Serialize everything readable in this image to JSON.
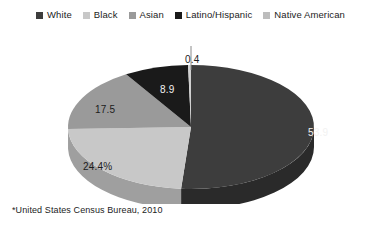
{
  "chart_data": {
    "type": "pie",
    "title": "",
    "subtitle": "",
    "xlabel": "",
    "ylabel": "",
    "legend_position": "top",
    "grid": false,
    "three_d": true,
    "units": "percent",
    "categories": [
      "White",
      "Black",
      "Asian",
      "Latino/Hispanic",
      "Native American"
    ],
    "values": [
      53.9,
      24.4,
      17.5,
      8.9,
      0.4
    ],
    "data_labels": [
      "53.9",
      "24.4%",
      "17.5",
      "8.9",
      "0.4"
    ],
    "colors": [
      "#3d3d3d",
      "#c8c8c8",
      "#9a9a9a",
      "#1a1a1a",
      "#d0d0d0"
    ],
    "side_colors": [
      "#2a2a2a",
      "#9f9f9f",
      "#757575",
      "#101010",
      "#a8a8a8"
    ],
    "label_text_colors": [
      "#f2f2f2",
      "#1c1c1c",
      "#1c1c1c",
      "#f2f2f2",
      "#1c1c1c"
    ],
    "slices": [
      {
        "name": "White",
        "value": 53.9,
        "label": "53.9",
        "color": "#3d3d3d",
        "side_color": "#2a2a2a",
        "text_color": "#f2f2f2"
      },
      {
        "name": "Black",
        "value": 24.4,
        "label": "24.4%",
        "color": "#c8c8c8",
        "side_color": "#9f9f9f",
        "text_color": "#1c1c1c"
      },
      {
        "name": "Asian",
        "value": 17.5,
        "label": "17.5",
        "color": "#9a9a9a",
        "side_color": "#757575",
        "text_color": "#1c1c1c"
      },
      {
        "name": "Latino/Hispanic",
        "value": 8.9,
        "label": "8.9",
        "color": "#1a1a1a",
        "side_color": "#101010",
        "text_color": "#f2f2f2"
      },
      {
        "name": "Native American",
        "value": 0.4,
        "label": "0.4",
        "color": "#d0d0d0",
        "side_color": "#a8a8a8",
        "text_color": "#1c1c1c"
      }
    ],
    "annotations": [
      {
        "text": "0.4",
        "for": "Native American",
        "has_leader_line": true
      }
    ]
  },
  "legend": {
    "items": [
      {
        "label": "White",
        "color": "#3d3d3d"
      },
      {
        "label": "Black",
        "color": "#c8c8c8"
      },
      {
        "label": "Asian",
        "color": "#9a9a9a"
      },
      {
        "label": "Latino/Hispanic",
        "color": "#1a1a1a"
      },
      {
        "label": "Native American",
        "color": "#bdbdbd"
      }
    ]
  },
  "footnote": {
    "text": "*United States Census Bureau, 2010"
  },
  "background": "#ffffff"
}
